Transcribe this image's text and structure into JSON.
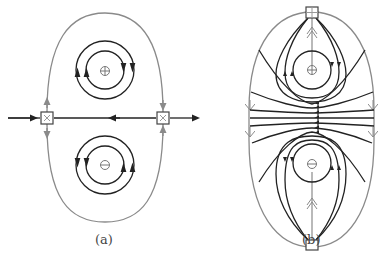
{
  "figure": {
    "panels": [
      {
        "id": "a",
        "label": "(a)",
        "description": "Two opposite circulations (plus and minus) with two X-point squares on a horizontal line inside a gray separatrix loop",
        "plus_symbol": "⊕",
        "minus_symbol": "⊖",
        "square_markers": [
          "left-x-square",
          "right-x-square"
        ]
      },
      {
        "id": "b",
        "label": "(b)",
        "description": "Field lines around plus and minus vortices with top and bottom squares connected by gray double-arrow lines, inside gray oval",
        "plus_symbol": "⊕",
        "minus_symbol": "⊖",
        "square_markers": [
          "top-plus-square",
          "bottom-square"
        ]
      }
    ],
    "colors": {
      "black_lines": "#222222",
      "gray_lines": "#8a8a8a",
      "symbol_gray": "#777777"
    }
  }
}
